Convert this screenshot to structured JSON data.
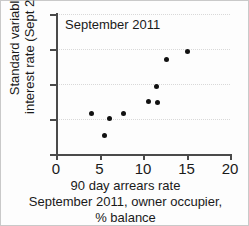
{
  "chart_data": {
    "type": "scatter",
    "title": "September 2011",
    "xlabel": "90 day arrears rate September 2011, owner occupier, % balance",
    "ylabel": "Standard variable interest rate (Sept 2011)",
    "xlim": [
      0,
      20
    ],
    "ylim": [
      3,
      7
    ],
    "xticks": [
      0,
      5,
      10,
      15,
      20
    ],
    "yticks": [
      3,
      4,
      5,
      6,
      7
    ],
    "xtick_labels": [
      "0",
      "5",
      "10",
      "15",
      "20"
    ],
    "ytick_labels": [
      "3",
      "4",
      "5",
      "6",
      "7"
    ],
    "grid": true,
    "grid_axis": "y",
    "legend": null,
    "marker": "filled-circle",
    "marker_color": "#111111",
    "points": [
      {
        "x": 4.1,
        "y": 4.17
      },
      {
        "x": 5.6,
        "y": 3.52
      },
      {
        "x": 6.1,
        "y": 4.02
      },
      {
        "x": 7.8,
        "y": 4.15
      },
      {
        "x": 10.6,
        "y": 4.51
      },
      {
        "x": 11.7,
        "y": 4.48
      },
      {
        "x": 11.5,
        "y": 4.94
      },
      {
        "x": 12.7,
        "y": 5.71
      },
      {
        "x": 15.1,
        "y": 5.93
      }
    ]
  },
  "axis_labels": {
    "y_lines": [
      "Standard variable",
      "interest rate (Sept 2011)"
    ],
    "x_lines": [
      "90 day arrears rate",
      "September 2011, owner occupier,",
      "% balance"
    ]
  }
}
